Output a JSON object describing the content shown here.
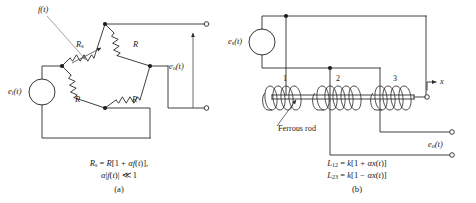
{
  "figure": {
    "background": "#ffffff",
    "ink": "#2a2a2a",
    "leader_color": "#8d8d8d"
  },
  "panel_a": {
    "letter": "(a)",
    "source_label_main": "e",
    "source_label_sub": "i",
    "source_label_tail": "(t)",
    "output_label_main": "e",
    "output_label_sub": "o",
    "output_label_tail": "(t)",
    "stimulus_label": "f(t)",
    "bridge": {
      "arm_top_left_main": "R",
      "arm_top_left_sub": "s",
      "arm_top_right": "R",
      "arm_bottom_left": "R",
      "arm_bottom_right": "R"
    },
    "caption_line1": "R_s = R[1 + αf(t)],",
    "caption_line2": "α|f(t)| ≪ 1",
    "caption_html_1": "<i>R</i><span class=\"sub\">s</span> = <i>R</i>[1 + <i>αf</i>(<i>t</i>)],",
    "caption_html_2": "<i>α</i>|<i>f</i>(<i>t</i>)| ≪ 1"
  },
  "panel_b": {
    "letter": "(b)",
    "source_label_main": "e",
    "source_label_sub": "s",
    "source_label_tail": "(t)",
    "output_label_main": "e",
    "output_label_sub": "o",
    "output_label_tail": "(t)",
    "displacement_label": "x",
    "rod_label": "Ferrous rod",
    "coil_labels": [
      "1",
      "2",
      "3"
    ],
    "caption_line1": "L₁₂ = k[1 + αx(t)]",
    "caption_line2": "L₂₃ = k[1 − αx(t)]",
    "caption_html_1": "<i>L</i><span class=\"sub\">12</span> = <i>k</i>[1 + <i>αx</i>(<i>t</i>)]",
    "caption_html_2": "<i>L</i><span class=\"sub\">23</span> = <i>k</i>[1 − <i>αx</i>(<i>t</i>)]"
  }
}
